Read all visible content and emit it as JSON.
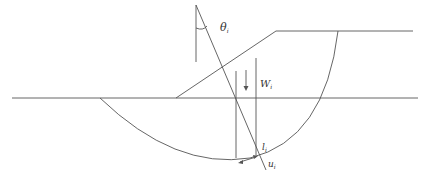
{
  "diagram": {
    "colors": {
      "line": "#555555",
      "label": "#333333",
      "background": "#ffffff"
    },
    "labels": {
      "theta": {
        "symbol": "θ",
        "subscript": "i"
      },
      "weight": {
        "symbol": "W",
        "subscript": "i"
      },
      "length": {
        "symbol": "l",
        "subscript": "i"
      },
      "pore_pressure": {
        "symbol": "u",
        "subscript": "i"
      }
    }
  }
}
